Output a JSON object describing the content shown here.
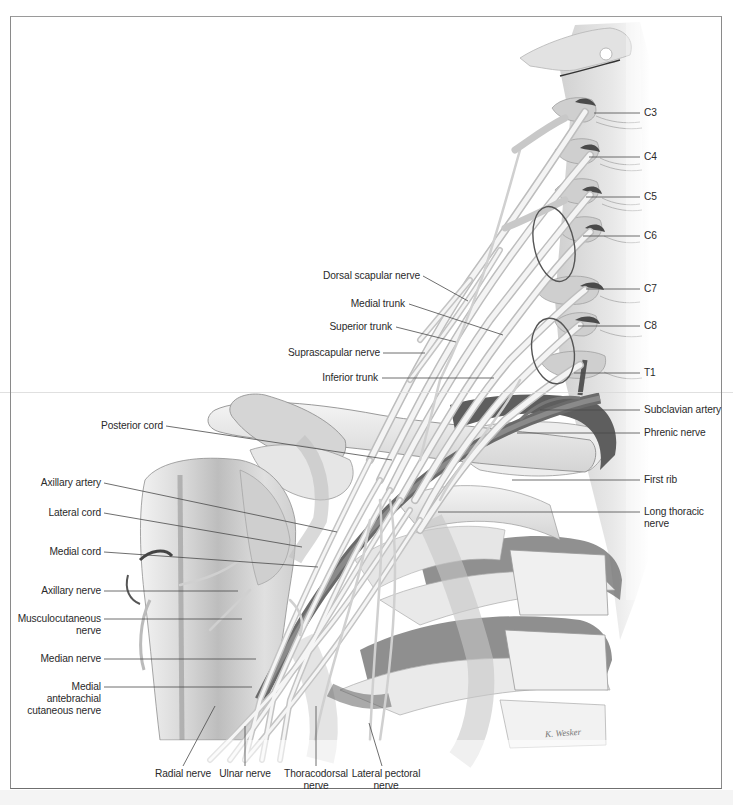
{
  "figure": {
    "signature": "K. Wesker",
    "colors": {
      "frame": "#8a8a8a",
      "label_text": "#2a2a2a",
      "leader_line": "#4a4a4a",
      "bone": "#ececec",
      "vessel": "#6a6a6a",
      "nerve": "#f2f2f2"
    }
  },
  "labels": {
    "right": [
      {
        "id": "c3",
        "text": "C3"
      },
      {
        "id": "c4",
        "text": "C4"
      },
      {
        "id": "c5",
        "text": "C5"
      },
      {
        "id": "c6",
        "text": "C6"
      },
      {
        "id": "c7",
        "text": "C7"
      },
      {
        "id": "c8",
        "text": "C8"
      },
      {
        "id": "t1",
        "text": "T1"
      },
      {
        "id": "subclavian-artery",
        "text": "Subclavian artery"
      },
      {
        "id": "phrenic-nerve",
        "text": "Phrenic nerve"
      },
      {
        "id": "first-rib",
        "text": "First rib"
      },
      {
        "id": "long-thoracic-nerve",
        "text": "Long thoracic\nnerve"
      }
    ],
    "middle": [
      {
        "id": "dorsal-scapular-nerve",
        "text": "Dorsal scapular nerve"
      },
      {
        "id": "medial-trunk",
        "text": "Medial trunk"
      },
      {
        "id": "superior-trunk",
        "text": "Superior trunk"
      },
      {
        "id": "suprascapular-nerve",
        "text": "Suprascapular nerve"
      },
      {
        "id": "inferior-trunk",
        "text": "Inferior trunk"
      }
    ],
    "left": [
      {
        "id": "posterior-cord",
        "text": "Posterior cord"
      },
      {
        "id": "axillary-artery",
        "text": "Axillary artery"
      },
      {
        "id": "lateral-cord",
        "text": "Lateral cord"
      },
      {
        "id": "medial-cord",
        "text": "Medial cord"
      },
      {
        "id": "axillary-nerve",
        "text": "Axillary nerve"
      },
      {
        "id": "musculocutaneous-nerve",
        "text": "Musculocutaneous\nnerve"
      },
      {
        "id": "median-nerve",
        "text": "Median nerve"
      },
      {
        "id": "medial-antebrachial-cutaneous-nerve",
        "text": "Medial\nantebrachial\ncutaneous nerve"
      }
    ],
    "bottom": [
      {
        "id": "radial-nerve",
        "text": "Radial nerve"
      },
      {
        "id": "ulnar-nerve",
        "text": "Ulnar nerve"
      },
      {
        "id": "thoracodorsal-nerve",
        "text": "Thoracodorsal\nnerve"
      },
      {
        "id": "lateral-pectoral-nerve",
        "text": "Lateral pectoral\nnerve"
      }
    ]
  }
}
